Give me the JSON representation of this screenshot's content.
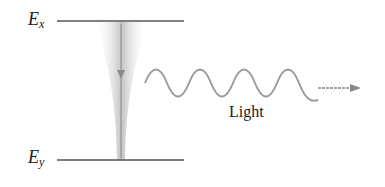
{
  "diagram": {
    "levels": {
      "upper": {
        "symbol": "E",
        "subscript": "x"
      },
      "lower": {
        "symbol": "E",
        "subscript": "y"
      }
    },
    "emission_label": "Light",
    "colors": {
      "level_line": "#555555",
      "funnel": "#c8c8c8",
      "wave": "#9a9a9a",
      "arrow": "#888888",
      "text": "#1a1a1a"
    }
  }
}
